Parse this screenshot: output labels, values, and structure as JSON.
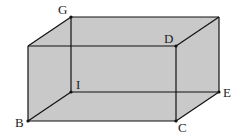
{
  "diagram": {
    "type": "rectangular-prism",
    "colors": {
      "fill": "#c9c9c9",
      "edge": "#111111",
      "background": "#ffffff",
      "label": "#222222"
    },
    "vertices": {
      "G": {
        "label": "G",
        "x": 71,
        "y": 17
      },
      "H": {
        "label": "",
        "x": 219,
        "y": 17
      },
      "A": {
        "label": "",
        "x": 28,
        "y": 46
      },
      "D": {
        "label": "D",
        "x": 176,
        "y": 46
      },
      "I": {
        "label": "I",
        "x": 71,
        "y": 92
      },
      "E": {
        "label": "E",
        "x": 219,
        "y": 92
      },
      "B": {
        "label": "B",
        "x": 28,
        "y": 121
      },
      "C": {
        "label": "C",
        "x": 176,
        "y": 121
      }
    },
    "labels": [
      {
        "id": "G",
        "text": "G",
        "x": 58,
        "y": 14
      },
      {
        "id": "D",
        "text": "D",
        "x": 164,
        "y": 43
      },
      {
        "id": "I",
        "text": "I",
        "x": 76,
        "y": 89
      },
      {
        "id": "E",
        "text": "E",
        "x": 223,
        "y": 97
      },
      {
        "id": "B",
        "text": "B",
        "x": 15,
        "y": 127
      },
      {
        "id": "C",
        "text": "C",
        "x": 178,
        "y": 132
      }
    ]
  }
}
